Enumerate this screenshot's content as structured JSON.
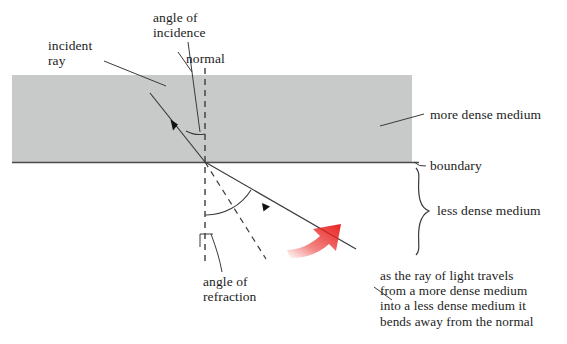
{
  "diagram": {
    "colors": {
      "dense_medium_fill": "#c7cac9",
      "line": "#3a3a3a",
      "text": "#1c1c1c",
      "arrow_accent": "#e8221f",
      "background": "#ffffff"
    },
    "labels": {
      "incident_ray": "incident\nray",
      "angle_of_incidence": "angle of\nincidence",
      "normal": "normal",
      "more_dense_medium": "more dense medium",
      "boundary": "boundary",
      "less_dense_medium": "less dense medium",
      "angle_of_refraction": "angle of\nrefraction",
      "caption": "as the ray of light travels\nfrom a more dense medium\ninto a less dense medium it\nbends away from the normal"
    },
    "parts": [
      {
        "name": "dense-medium-band",
        "kind": "region"
      },
      {
        "name": "boundary-line",
        "kind": "line"
      },
      {
        "name": "normal-line",
        "kind": "dashed-line"
      },
      {
        "name": "incident-ray",
        "kind": "ray"
      },
      {
        "name": "refracted-ray",
        "kind": "ray"
      },
      {
        "name": "incident-ray-extension",
        "kind": "dashed-line"
      },
      {
        "name": "angle-of-incidence-arc",
        "kind": "arc"
      },
      {
        "name": "angle-of-refraction-arc",
        "kind": "arc"
      },
      {
        "name": "red-direction-arrow",
        "kind": "annotation-arrow"
      },
      {
        "name": "less-dense-medium-brace",
        "kind": "brace"
      }
    ]
  }
}
